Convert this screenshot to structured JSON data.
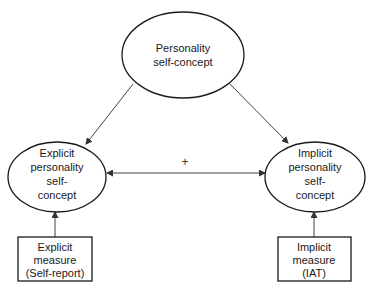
{
  "diagram": {
    "type": "path-model",
    "nodes": {
      "personality": {
        "shape": "ellipse",
        "lines": [
          "Personality",
          "self-concept"
        ]
      },
      "explicit": {
        "shape": "ellipse",
        "lines": [
          "Explicit",
          "personality",
          "self-",
          "concept"
        ]
      },
      "implicit": {
        "shape": "ellipse",
        "lines": [
          "Implicit",
          "personality",
          "self-",
          "concept"
        ]
      },
      "explicit_measure": {
        "shape": "rectangle",
        "lines": [
          "Explicit",
          "measure",
          "(Self-report)"
        ]
      },
      "implicit_measure": {
        "shape": "rectangle",
        "lines": [
          "Implicit",
          "measure",
          "(IAT)"
        ]
      }
    },
    "edges": [
      {
        "from": "personality",
        "to": "explicit",
        "direction": "forward"
      },
      {
        "from": "personality",
        "to": "implicit",
        "direction": "forward"
      },
      {
        "from": "explicit",
        "to": "implicit",
        "direction": "bidirectional",
        "label": "+"
      },
      {
        "from": "explicit_measure",
        "to": "explicit",
        "direction": "forward"
      },
      {
        "from": "implicit_measure",
        "to": "implicit",
        "direction": "forward"
      }
    ],
    "correlation_label": "+",
    "colors": {
      "stroke": "#1a1a1a",
      "edge": "#444444",
      "background": "#ffffff"
    }
  }
}
